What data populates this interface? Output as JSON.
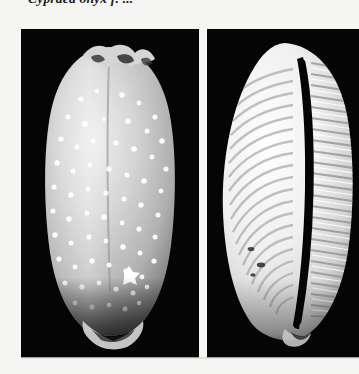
{
  "page": {
    "background_color": "#f5f5f3",
    "width": 359,
    "height": 374
  },
  "caption": {
    "text": "Cypraea onyx f. ...",
    "note": "clipped at top edge of scan",
    "color": "#1a1a1a"
  },
  "plate": {
    "name": "shell-specimen-plate",
    "panel_background": "#050505",
    "panels": [
      {
        "id": "dorsal",
        "view_label": "dorsal view",
        "description": "Cowrie shell dorsum, grey ground densely covered with small white spots, dark nodular callus at apex and dark base.",
        "shell_body_color": "#b9b9b9",
        "shell_highlight_color": "#f2f2f2",
        "spot_color": "#ffffff",
        "background_color": "#050505"
      },
      {
        "id": "ventral",
        "view_label": "ventral view",
        "description": "Cowrie shell ventral surface showing narrow dark aperture flanked by strong white teeth ridges on both labral and columellar margins.",
        "shell_body_color": "#ededed",
        "shell_highlight_color": "#ffffff",
        "aperture_color": "#040404",
        "background_color": "#050505"
      }
    ]
  }
}
